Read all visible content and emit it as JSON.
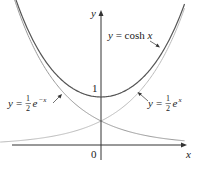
{
  "chart_data": {
    "type": "line",
    "title": "",
    "xlabel": "x",
    "ylabel": "y",
    "xlim": [
      -2.1,
      1.75
    ],
    "ylim": [
      0,
      2.9
    ],
    "grid": false,
    "tick_labels": {
      "origin": "0",
      "y_one": "1"
    },
    "series": [
      {
        "name": "y = cosh x",
        "function": "cosh(x)",
        "color": "#555555"
      },
      {
        "name": "y = 1/2 e^x",
        "function": "0.5*exp(x)",
        "color": "#bbbbbb"
      },
      {
        "name": "y = 1/2 e^-x",
        "function": "0.5*exp(-x)",
        "color": "#999999"
      }
    ],
    "annotations": [
      {
        "text": "y = cosh x",
        "points_to": "cosh curve (right branch)"
      },
      {
        "text": "y = ½e^(−x)",
        "points_to": "decaying exponential (left)"
      },
      {
        "text": "y = ½e^x",
        "points_to": "growing exponential (right)"
      }
    ]
  },
  "labels": {
    "y_axis": "y",
    "x_axis": "x",
    "origin": "0",
    "one": "1",
    "cosh_prefix": "y = cosh ",
    "cosh_var": "x",
    "y_eq": "y =",
    "half_num": "1",
    "half_den": "2",
    "e": "e",
    "neg_x": "−x",
    "pos_x": "x"
  }
}
